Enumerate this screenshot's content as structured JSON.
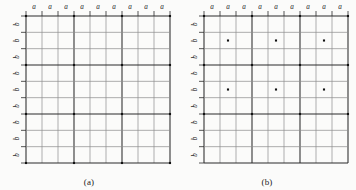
{
  "figure": {
    "background_color": "#fbfbfa",
    "line_color_major": "#2b2b2b",
    "line_color_minor": "#8d8d8d",
    "dot_color": "#111111"
  },
  "chart_data": {
    "type": "scatter",
    "title": "",
    "xlabel": "",
    "ylabel": "",
    "panels": [
      {
        "id": "a",
        "caption": "(a)",
        "lattice_type": "primitive rectangular",
        "grid": {
          "x_divisions": 9,
          "y_divisions": 9,
          "x_lines": 10,
          "y_lines": 10,
          "major_every": 3,
          "grid_on": true
        },
        "xlim": [
          0,
          9
        ],
        "ylim": [
          0,
          9
        ],
        "top_tick_labels": [
          "a",
          "a",
          "a",
          "a",
          "a",
          "a",
          "a",
          "a",
          "a"
        ],
        "left_tick_labels": [
          "b",
          "b",
          "b",
          "b",
          "b",
          "b",
          "b",
          "b",
          "b"
        ],
        "points_x": [
          0,
          3,
          6,
          9,
          0,
          3,
          6,
          9,
          0,
          3,
          6,
          9,
          0,
          3,
          6,
          9
        ],
        "points_y": [
          0,
          0,
          0,
          0,
          3,
          3,
          3,
          3,
          6,
          6,
          6,
          6,
          9,
          9,
          9,
          9
        ]
      },
      {
        "id": "b",
        "caption": "(b)",
        "lattice_type": "centered rectangular",
        "grid": {
          "x_divisions": 9,
          "y_divisions": 9,
          "x_lines": 10,
          "y_lines": 10,
          "major_every": 3,
          "grid_on": true
        },
        "xlim": [
          0,
          9
        ],
        "ylim": [
          0,
          9
        ],
        "top_tick_labels": [
          "a",
          "a",
          "a",
          "a",
          "a",
          "a",
          "a",
          "a",
          "a"
        ],
        "left_tick_labels": [
          "b",
          "b",
          "b",
          "b",
          "b",
          "b",
          "b",
          "b",
          "b"
        ],
        "points_x": [
          0,
          3,
          6,
          9,
          1.5,
          4.5,
          7.5,
          0,
          3,
          6,
          9,
          1.5,
          4.5,
          7.5,
          0,
          3,
          6,
          9
        ],
        "points_y": [
          0,
          0,
          0,
          0,
          1.5,
          1.5,
          1.5,
          3,
          3,
          3,
          3,
          4.5,
          4.5,
          4.5,
          6,
          6,
          6,
          6
        ]
      }
    ]
  },
  "panel_a": {
    "caption": "(a)",
    "top_labels": [
      "a",
      "a",
      "a",
      "a",
      "a",
      "a",
      "a",
      "a",
      "a"
    ],
    "left_labels": [
      "b",
      "b",
      "b",
      "b",
      "b",
      "b",
      "b",
      "b",
      "b"
    ]
  },
  "panel_b": {
    "caption": "(b)",
    "top_labels": [
      "a",
      "a",
      "a",
      "a",
      "a",
      "a",
      "a",
      "a",
      "a"
    ],
    "left_labels": [
      "b",
      "b",
      "b",
      "b",
      "b",
      "b",
      "b",
      "b",
      "b"
    ]
  }
}
